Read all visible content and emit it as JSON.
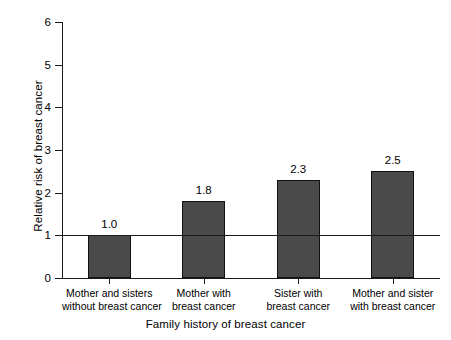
{
  "chart_data": {
    "type": "bar",
    "title": "",
    "subtitle": "",
    "categories": [
      "Mother and sisters without breast cancer",
      "Mother with breast cancer",
      "Sister with breast cancer",
      "Mother and sister with breast cancer"
    ],
    "category_lines": [
      [
        "Mother and sisters",
        "without breast cancer"
      ],
      [
        "Mother with",
        "breast cancer"
      ],
      [
        "Sister with",
        "breast cancer"
      ],
      [
        "Mother and sister",
        "with breast cancer"
      ]
    ],
    "values": [
      1.0,
      1.8,
      2.3,
      2.5
    ],
    "value_labels": [
      "1.0",
      "1.8",
      "2.3",
      "2.5"
    ],
    "xlabel": "Family history of breast cancer",
    "ylabel": "Relative risk of breast cancer",
    "ylim": [
      0,
      6
    ],
    "ytick_labels": [
      "0",
      "1",
      "2",
      "3",
      "4",
      "5",
      "6"
    ],
    "ytick_values": [
      0,
      1,
      2,
      3,
      4,
      5,
      6
    ],
    "grid": false,
    "legend": false,
    "legend_position": "none",
    "reference_line": {
      "value": 1,
      "label": "",
      "color": "#1a1a1a"
    },
    "colors": {
      "bar_fill": "#4a4a4a",
      "bar_edge": "#111111",
      "axis": "#1a1a1a",
      "text": "#000000",
      "background": "#ffffff"
    }
  }
}
